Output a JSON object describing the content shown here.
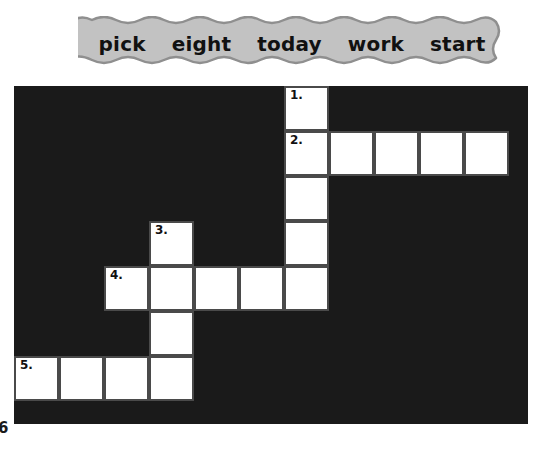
{
  "word_bank": {
    "name": "word-bank",
    "shape": "scalloped-banner",
    "fill_color": "#c2c2c2",
    "border_color": "#8f8f8f",
    "words": [
      "pick",
      "eight",
      "today",
      "work",
      "start"
    ]
  },
  "crossword": {
    "background_color": "#1a1a1a",
    "cell_fill_color": "#ffffff",
    "cell_border_color": "#4a4a4a",
    "columns": 11,
    "rows": 7,
    "cell_size": 45,
    "clue_numbers": [
      "1.",
      "2.",
      "3.",
      "4.",
      "5."
    ],
    "entries": [
      {
        "number": "1.",
        "direction": "down",
        "col": 6,
        "row": 0,
        "length": 5
      },
      {
        "number": "2.",
        "direction": "across",
        "col": 6,
        "row": 1,
        "length": 5
      },
      {
        "number": "3.",
        "direction": "down",
        "col": 3,
        "row": 3,
        "length": 4
      },
      {
        "number": "4.",
        "direction": "across",
        "col": 2,
        "row": 4,
        "length": 5
      },
      {
        "number": "5.",
        "direction": "across",
        "col": 0,
        "row": 6,
        "length": 4
      }
    ],
    "cells": [
      {
        "col": 6,
        "row": 0,
        "number": "1.",
        "letter": ""
      },
      {
        "col": 6,
        "row": 1,
        "number": "2.",
        "letter": ""
      },
      {
        "col": 7,
        "row": 1,
        "number": "",
        "letter": ""
      },
      {
        "col": 8,
        "row": 1,
        "number": "",
        "letter": ""
      },
      {
        "col": 9,
        "row": 1,
        "number": "",
        "letter": ""
      },
      {
        "col": 10,
        "row": 1,
        "number": "",
        "letter": ""
      },
      {
        "col": 6,
        "row": 2,
        "number": "",
        "letter": ""
      },
      {
        "col": 3,
        "row": 3,
        "number": "3.",
        "letter": ""
      },
      {
        "col": 6,
        "row": 3,
        "number": "",
        "letter": ""
      },
      {
        "col": 2,
        "row": 4,
        "number": "4.",
        "letter": ""
      },
      {
        "col": 3,
        "row": 4,
        "number": "",
        "letter": ""
      },
      {
        "col": 4,
        "row": 4,
        "number": "",
        "letter": ""
      },
      {
        "col": 5,
        "row": 4,
        "number": "",
        "letter": ""
      },
      {
        "col": 6,
        "row": 4,
        "number": "",
        "letter": ""
      },
      {
        "col": 3,
        "row": 5,
        "number": "",
        "letter": ""
      },
      {
        "col": 0,
        "row": 6,
        "number": "5.",
        "letter": ""
      },
      {
        "col": 1,
        "row": 6,
        "number": "",
        "letter": ""
      },
      {
        "col": 2,
        "row": 6,
        "number": "",
        "letter": ""
      },
      {
        "col": 3,
        "row": 6,
        "number": "",
        "letter": ""
      }
    ]
  },
  "page_mark": {
    "text": "6"
  }
}
